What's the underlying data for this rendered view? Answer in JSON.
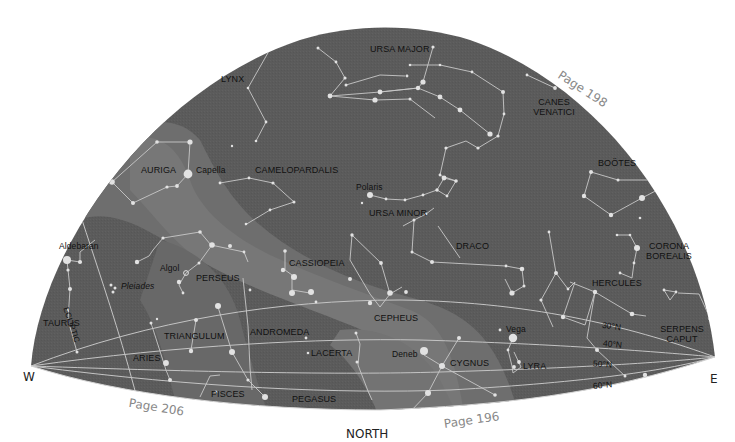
{
  "map": {
    "title": "Northern sky star chart",
    "colors": {
      "sky": "#5b5b5b",
      "milky_way": "#717171",
      "milky_way_core": "#7c7c7c",
      "lines": "#c9c9c9",
      "stars": "#e4e4e4",
      "label": "#111111",
      "page_ref": "#888888"
    },
    "compass": {
      "west": "W",
      "east": "E",
      "north": "NORTH"
    },
    "page_refs": [
      {
        "label": "Page 198"
      },
      {
        "label": "Page 206"
      },
      {
        "label": "Page 196"
      }
    ],
    "constellations": [
      {
        "name": "URSA MAJOR"
      },
      {
        "name": "LYNX"
      },
      {
        "name": "CANES VENATICI",
        "line1": "CANES",
        "line2": "VENATICI"
      },
      {
        "name": "AURIGA"
      },
      {
        "name": "CAMELOPARDALIS"
      },
      {
        "name": "BOÖTES"
      },
      {
        "name": "URSA MINOR"
      },
      {
        "name": "DRACO"
      },
      {
        "name": "CORONA BOREALIS",
        "line1": "CORONA",
        "line2": "BOREALIS"
      },
      {
        "name": "PERSEUS"
      },
      {
        "name": "CASSIOPEIA"
      },
      {
        "name": "HERCULES"
      },
      {
        "name": "TAURUS"
      },
      {
        "name": "CEPHEUS"
      },
      {
        "name": "TRIANGULUM"
      },
      {
        "name": "ANDROMEDA"
      },
      {
        "name": "SERPENS CAPUT",
        "line1": "SERPENS",
        "line2": "CAPUT"
      },
      {
        "name": "ARIES"
      },
      {
        "name": "LACERTA"
      },
      {
        "name": "CYGNUS"
      },
      {
        "name": "LYRA"
      },
      {
        "name": "PISCES"
      },
      {
        "name": "PEGASUS"
      }
    ],
    "stars": [
      {
        "name": "Capella"
      },
      {
        "name": "Polaris"
      },
      {
        "name": "Aldebaran"
      },
      {
        "name": "Algol"
      },
      {
        "name": "Pleiades"
      },
      {
        "name": "Vega"
      },
      {
        "name": "Deneb"
      }
    ],
    "ecliptic_label": "ECLIPTIC",
    "latitudes": [
      "30°N",
      "40°N",
      "50°N",
      "60°N"
    ]
  }
}
